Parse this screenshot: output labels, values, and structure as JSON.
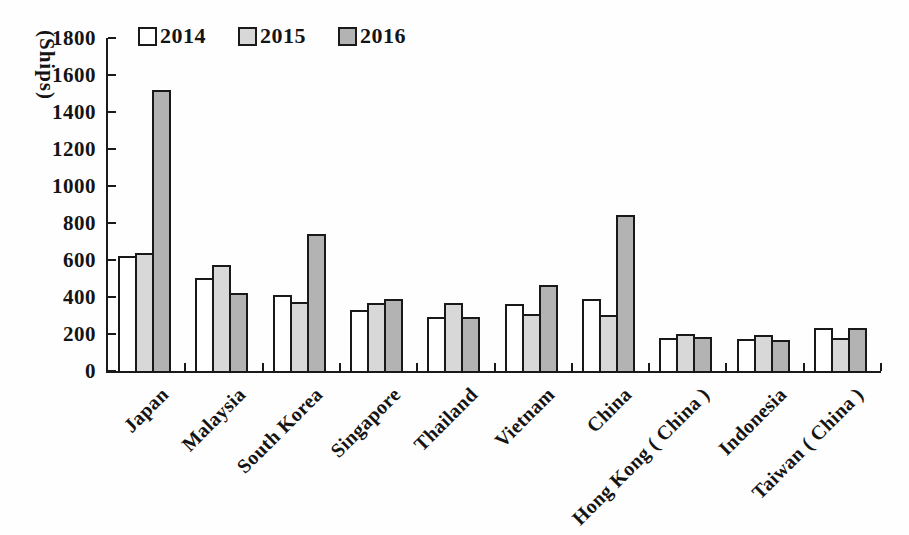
{
  "figure": {
    "ylabel": "(Ships)"
  },
  "chart_data": {
    "type": "bar",
    "title": "",
    "xlabel": "",
    "ylabel": "(Ships)",
    "categories": [
      "Japan",
      "Malaysia",
      "South Korea",
      "Singapore",
      "Thailand",
      "Vietnam",
      "China",
      "Hong Kong ( China )",
      "Indonesia",
      "Taiwan ( China )"
    ],
    "series": [
      {
        "name": "2014",
        "color": "#ffffff",
        "values": [
          620,
          500,
          410,
          330,
          290,
          360,
          390,
          180,
          175,
          235
        ]
      },
      {
        "name": "2015",
        "color": "#d8d8d8",
        "values": [
          640,
          575,
          375,
          370,
          370,
          310,
          300,
          200,
          195,
          180
        ]
      },
      {
        "name": "2016",
        "color": "#b3b3b3",
        "values": [
          1520,
          420,
          740,
          390,
          290,
          465,
          845,
          185,
          170,
          235
        ]
      }
    ],
    "ylim": [
      0,
      1800
    ],
    "ytick_step": 200,
    "legend_position": "top",
    "grid": false,
    "axis_color": "#1a1a1a"
  }
}
